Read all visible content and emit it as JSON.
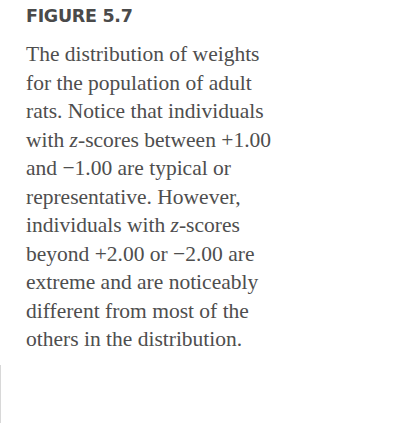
{
  "figure": {
    "label": "FIGURE 5.7",
    "caption_lines": [
      "The distribution of weights",
      "for the population of adult",
      "rats. Notice that individuals",
      [
        "with ",
        "z",
        "-scores between +1.00"
      ],
      "and −1.00 are typical or",
      "representative. However,",
      [
        "individuals with ",
        "z",
        "-scores"
      ],
      "beyond +2.00 or −2.00 are",
      "extreme and are noticeably",
      "different from most of the",
      "others in the distribution."
    ],
    "caption": {
      "l0": "The distribution of weights",
      "l1": "for the population of adult",
      "l2": "rats. Notice that individuals",
      "l3a": "with ",
      "l3z": "z",
      "l3b": "-scores between +1.00",
      "l4": "and −1.00 are typical or",
      "l5": "representative. However,",
      "l6a": "individuals with ",
      "l6z": "z",
      "l6b": "-scores",
      "l7": "beyond +2.00 or −2.00 are",
      "l8": "extreme and are noticeably",
      "l9": "different from most of the",
      "l10": "others in the distribution."
    }
  },
  "colors": {
    "text": "#4e4e4e",
    "label": "#4a4a4a",
    "background": "#ffffff"
  }
}
